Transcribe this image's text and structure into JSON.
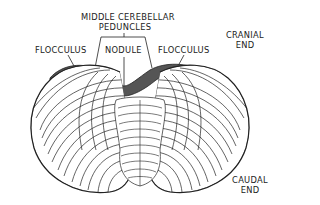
{
  "figure": {
    "labels": {
      "middle_cerebellar_peduncles_line1": "MIDDLE CEREBELLAR",
      "middle_cerebellar_peduncles_line2": "PEDUNCLES",
      "flocculus_left": "FLOCCULUS",
      "nodule": "NODULE",
      "flocculus_right": "FLOCCULUS",
      "cranial_end_line1": "CRANIAL",
      "cranial_end_line2": "END",
      "caudal_end_line1": "CAUDAL",
      "caudal_end_line2": "END"
    },
    "colors": {
      "line": "#222222",
      "shade": "#555555",
      "background": "#ffffff"
    }
  }
}
